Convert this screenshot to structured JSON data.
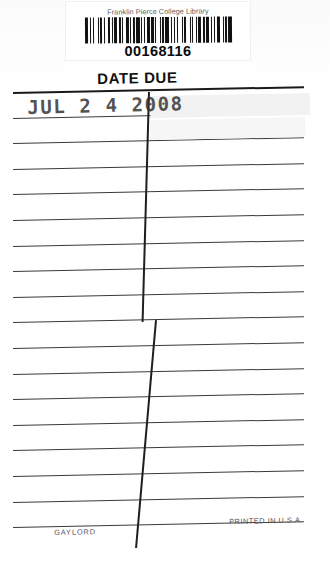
{
  "card": {
    "type": "library-date-due-card",
    "background_color": "#ffffff",
    "ink_color": "#2b2b2b"
  },
  "barcode": {
    "library_name": "Franklin Pierce College Library",
    "number": "00168116",
    "bar_pattern": [
      3,
      1,
      1,
      2,
      1,
      3,
      1,
      1,
      2,
      1,
      1,
      3,
      2,
      1,
      1,
      1,
      3,
      1,
      2,
      1,
      1,
      2,
      3,
      1,
      1,
      1,
      2,
      1,
      3,
      1,
      1,
      2,
      1,
      1,
      3,
      1,
      2,
      1,
      1,
      3,
      1,
      1,
      2,
      1,
      3,
      2,
      1,
      1,
      1,
      2,
      1,
      3,
      1,
      1,
      2,
      3,
      1,
      1,
      1,
      2,
      1,
      1,
      3,
      1,
      2,
      1,
      3,
      1,
      1,
      2,
      1,
      1,
      3,
      2,
      1,
      1,
      2,
      1,
      3,
      1
    ]
  },
  "heading": {
    "title": "DATE DUE"
  },
  "stamp": {
    "text": "JUL 2 4 2008",
    "month": "JUL",
    "day": "2 4",
    "year": "2008"
  },
  "footer": {
    "manufacturer": "GAYLORD",
    "origin": "PRINTED IN U.S.A."
  },
  "ruling": {
    "line_count": 18,
    "first_line_y": 92,
    "spacing": 25.6,
    "left_x": 13,
    "right_x": 304,
    "tilt_degrees": -1.15,
    "divider_top_x": 148,
    "divider_bottom_x": 178
  }
}
